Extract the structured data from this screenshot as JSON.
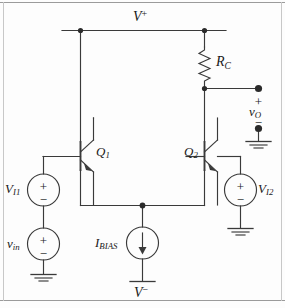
{
  "figure": {
    "type": "circuit-schematic"
  },
  "labels": {
    "supply_positive": {
      "base": "V",
      "sup": "+"
    },
    "supply_negative": {
      "base": "V",
      "sup": "−"
    },
    "resistor_collector": {
      "base": "R",
      "sub": "C"
    },
    "transistor_q1": {
      "base": "Q",
      "sub": "1"
    },
    "transistor_q2": {
      "base": "Q",
      "sub": "2"
    },
    "source_vi1": {
      "base": "V",
      "sub": "I1"
    },
    "source_vi2": {
      "base": "V",
      "sub": "I2"
    },
    "source_vin": {
      "base": "v",
      "sub": "in"
    },
    "output_voltage": {
      "base": "v",
      "sub": "O"
    },
    "current_source_bias": {
      "base": "I",
      "sub": "BIAS"
    }
  },
  "polarity_marks": {
    "plus": "+",
    "minus": "−"
  },
  "components": [
    {
      "name": "vi1-source",
      "kind": "voltage-source",
      "label": "V_I1",
      "plus": "top",
      "minus": "bottom"
    },
    {
      "name": "vin-source",
      "kind": "voltage-source",
      "label": "v_in",
      "plus": "top",
      "minus": "bottom"
    },
    {
      "name": "vi2-source",
      "kind": "voltage-source",
      "label": "V_I2",
      "plus": "top",
      "minus": "bottom"
    },
    {
      "name": "ibias-source",
      "kind": "current-source",
      "label": "I_BIAS",
      "direction": "down"
    },
    {
      "name": "rc-resistor",
      "kind": "resistor",
      "label": "R_C"
    },
    {
      "name": "q1-transistor",
      "kind": "npn-bjt",
      "label": "Q_1"
    },
    {
      "name": "q2-transistor",
      "kind": "npn-bjt",
      "label": "Q_2"
    }
  ],
  "colors": {
    "wire": "#3a3a3a",
    "node": "#2b2b2b",
    "text": "#1a1a1a",
    "border": "#9b9b9b",
    "background": "#fdfdfd"
  }
}
